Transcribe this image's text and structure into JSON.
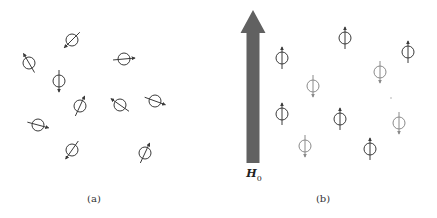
{
  "colors": {
    "dark_dipole": "#3a3a3a",
    "light_dipole": "#8a8a8a",
    "field_arrow": "#616161",
    "background": "#ffffff"
  },
  "panel_a": {
    "label": "(a)",
    "label_pos": [
      94,
      198
    ],
    "description": "randomly oriented magnetic dipoles (no applied field)",
    "dipoles": [
      {
        "x": 72,
        "y": 40,
        "angle_deg": 225
      },
      {
        "x": 29,
        "y": 63,
        "angle_deg": -30
      },
      {
        "x": 59,
        "y": 81,
        "angle_deg": 180
      },
      {
        "x": 124,
        "y": 59,
        "angle_deg": 85
      },
      {
        "x": 120,
        "y": 105,
        "angle_deg": -55
      },
      {
        "x": 155,
        "y": 101,
        "angle_deg": 110
      },
      {
        "x": 80,
        "y": 106,
        "angle_deg": 25
      },
      {
        "x": 38,
        "y": 125,
        "angle_deg": 105
      },
      {
        "x": 72,
        "y": 150,
        "angle_deg": 215
      },
      {
        "x": 145,
        "y": 153,
        "angle_deg": 25
      }
    ]
  },
  "panel_b": {
    "label": "(b)",
    "label_pos": [
      323,
      198
    ],
    "field_label": "H",
    "field_label_sub": "0",
    "field_label_pos": [
      254,
      175
    ],
    "description": "dipoles aligned parallel or antiparallel to applied field H0",
    "field_arrow": {
      "x": 253,
      "top": 10,
      "bottom": 163,
      "shaft_width": 13,
      "head_width": 25,
      "head_height": 23
    },
    "dipoles": [
      {
        "x": 282,
        "y": 58,
        "dir": "up",
        "tone": "dark"
      },
      {
        "x": 345,
        "y": 38,
        "dir": "up",
        "tone": "dark"
      },
      {
        "x": 408,
        "y": 52,
        "dir": "up",
        "tone": "dark"
      },
      {
        "x": 313,
        "y": 86,
        "dir": "down",
        "tone": "light"
      },
      {
        "x": 380,
        "y": 72,
        "dir": "down",
        "tone": "light"
      },
      {
        "x": 282,
        "y": 114,
        "dir": "up",
        "tone": "dark"
      },
      {
        "x": 340,
        "y": 119,
        "dir": "up",
        "tone": "dark"
      },
      {
        "x": 399,
        "y": 123,
        "dir": "down",
        "tone": "light"
      },
      {
        "x": 305,
        "y": 146,
        "dir": "down",
        "tone": "light"
      },
      {
        "x": 370,
        "y": 149,
        "dir": "up",
        "tone": "dark"
      }
    ],
    "stray_dot": {
      "x": 391,
      "y": 98
    }
  }
}
